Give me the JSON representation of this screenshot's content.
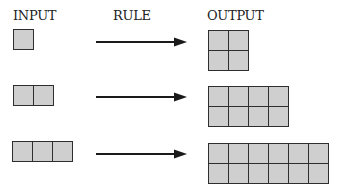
{
  "headers": {
    "input": "INPUT",
    "rule": "RULE",
    "output": "OUTPUT"
  },
  "colors": {
    "cell_fill": "#cfcfcf",
    "cell_border": "#2e2e2e",
    "arrow": "#1a1a1a"
  },
  "rows": [
    {
      "input": {
        "cols": 1,
        "rows": 1
      },
      "output": {
        "cols": 2,
        "rows": 2
      }
    },
    {
      "input": {
        "cols": 2,
        "rows": 1
      },
      "output": {
        "cols": 4,
        "rows": 2
      }
    },
    {
      "input": {
        "cols": 3,
        "rows": 1
      },
      "output": {
        "cols": 6,
        "rows": 2
      }
    }
  ]
}
